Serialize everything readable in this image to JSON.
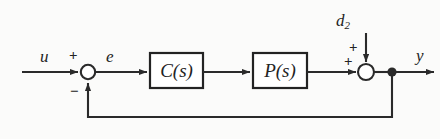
{
  "diagram": {
    "type": "control-system-block-diagram",
    "colors": {
      "background": "#fbfbfa",
      "line": "#2a2a2a",
      "text": "#232323",
      "block_fill": "#ffffff",
      "block_border": "#232323"
    },
    "signals": {
      "input_label": "u",
      "error_label": "e",
      "disturbance_label_base": "d",
      "disturbance_label_sub": "2",
      "output_label": "y"
    },
    "blocks": [
      {
        "name": "controller",
        "label_base": "C",
        "label_arg": "(s)"
      },
      {
        "name": "plant",
        "label_base": "P",
        "label_arg": "(s)"
      }
    ],
    "summing_junctions": [
      {
        "name": "error-junction",
        "signs": [
          {
            "value": "+",
            "position": "top"
          },
          {
            "value": "−",
            "position": "bottom-left"
          }
        ]
      },
      {
        "name": "output-junction",
        "signs": [
          {
            "value": "+",
            "position": "top-left"
          },
          {
            "value": "+",
            "position": "left"
          }
        ]
      }
    ],
    "nodes": [
      {
        "name": "output-takeoff-node"
      }
    ]
  }
}
